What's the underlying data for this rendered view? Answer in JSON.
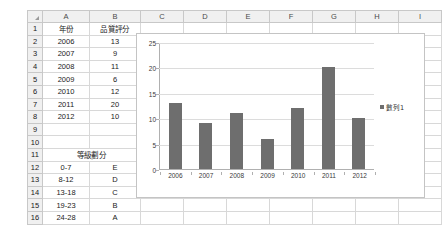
{
  "spreadsheet": {
    "column_headers": [
      "A",
      "B",
      "C",
      "D",
      "E",
      "F",
      "G",
      "H",
      "I"
    ],
    "row_numbers": [
      "1",
      "2",
      "3",
      "4",
      "5",
      "6",
      "7",
      "8",
      "9",
      "10",
      "11",
      "12",
      "13",
      "14",
      "15",
      "16"
    ],
    "rows": [
      {
        "num": "1",
        "a": "年份",
        "b": "品質評分"
      },
      {
        "num": "2",
        "a": "2006",
        "b": "13"
      },
      {
        "num": "3",
        "a": "2007",
        "b": "9"
      },
      {
        "num": "4",
        "a": "2008",
        "b": "11"
      },
      {
        "num": "5",
        "a": "2009",
        "b": "6"
      },
      {
        "num": "6",
        "a": "2010",
        "b": "12"
      },
      {
        "num": "7",
        "a": "2011",
        "b": "20"
      },
      {
        "num": "8",
        "a": "2012",
        "b": "10"
      },
      {
        "num": "9",
        "a": "",
        "b": ""
      },
      {
        "num": "10",
        "a": "",
        "b": ""
      },
      {
        "num": "11",
        "a": "等級劃分",
        "b": ""
      },
      {
        "num": "12",
        "a": "0-7",
        "b": "E"
      },
      {
        "num": "13",
        "a": "8-12",
        "b": "D"
      },
      {
        "num": "14",
        "a": "13-18",
        "b": "C"
      },
      {
        "num": "15",
        "a": "19-23",
        "b": "B"
      },
      {
        "num": "16",
        "a": "24-28",
        "b": "A"
      }
    ]
  },
  "chart_data": {
    "type": "bar",
    "title": "",
    "xlabel": "",
    "ylabel": "",
    "categories": [
      "2006",
      "2007",
      "2008",
      "2009",
      "2010",
      "2011",
      "2012"
    ],
    "values": [
      13,
      9,
      11,
      6,
      12,
      20,
      10
    ],
    "series": [
      {
        "name": "數列1",
        "values": [
          13,
          9,
          11,
          6,
          12,
          20,
          10
        ]
      }
    ],
    "ylim": [
      0,
      25
    ],
    "yticks": [
      "0",
      "5",
      "10",
      "15",
      "20",
      "25"
    ],
    "grid": true,
    "legend_position": "right",
    "legend_entries": [
      "數列1"
    ],
    "bar_color": "#6e6e6e",
    "gridline_color": "#dcdcdc",
    "plot_background": "#ffffff"
  }
}
